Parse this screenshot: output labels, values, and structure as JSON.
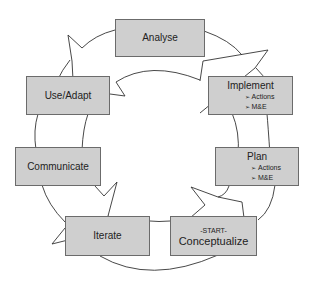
{
  "diagram": {
    "type": "cycle",
    "colors": {
      "box_fill": "#cfcfcf",
      "box_border": "#6b6b6b",
      "line": "#333333"
    },
    "nodes": [
      {
        "id": "analyse",
        "label": "Analyse"
      },
      {
        "id": "implement",
        "label": "Implement",
        "bullets": [
          "Actions",
          "M&E"
        ]
      },
      {
        "id": "plan",
        "label": "Plan",
        "bullets": [
          "Actions",
          "M&E"
        ]
      },
      {
        "id": "conceptualize",
        "prefix": "-START-",
        "label": "Conceptualize"
      },
      {
        "id": "iterate",
        "label": "Iterate"
      },
      {
        "id": "communicate",
        "label": "Communicate"
      },
      {
        "id": "use-adapt",
        "label": "Use/Adapt"
      }
    ]
  }
}
